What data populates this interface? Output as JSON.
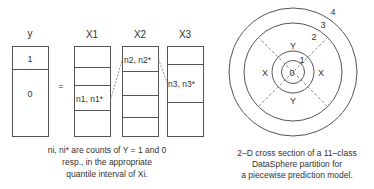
{
  "left_diagram": {
    "columns": [
      {
        "header": "y",
        "cells": [
          "1",
          "0"
        ]
      },
      {
        "header": "X1",
        "cell_label": "n1, n1*"
      },
      {
        "header": "X2",
        "cell_label": "n2, n2*"
      },
      {
        "header": "X3",
        "cell_label": "n3, n3*"
      }
    ],
    "equals": "=",
    "caption": [
      "ni, ni* are counts of Y = 1 and 0",
      "resp., in the appropriate",
      "quantile interval of Xi."
    ]
  },
  "right_diagram": {
    "ring_labels": [
      "0",
      "1",
      "2",
      "3",
      "4"
    ],
    "region_labels": {
      "top": "Y",
      "bottom": "Y",
      "left": "X",
      "right": "X"
    },
    "caption": [
      "2–D cross section of a 11–class",
      "DataSphere partition for",
      "a piecewise prediction model."
    ]
  },
  "colors": {
    "line": "#555555",
    "text": "#333333",
    "background": "#ffffff"
  }
}
